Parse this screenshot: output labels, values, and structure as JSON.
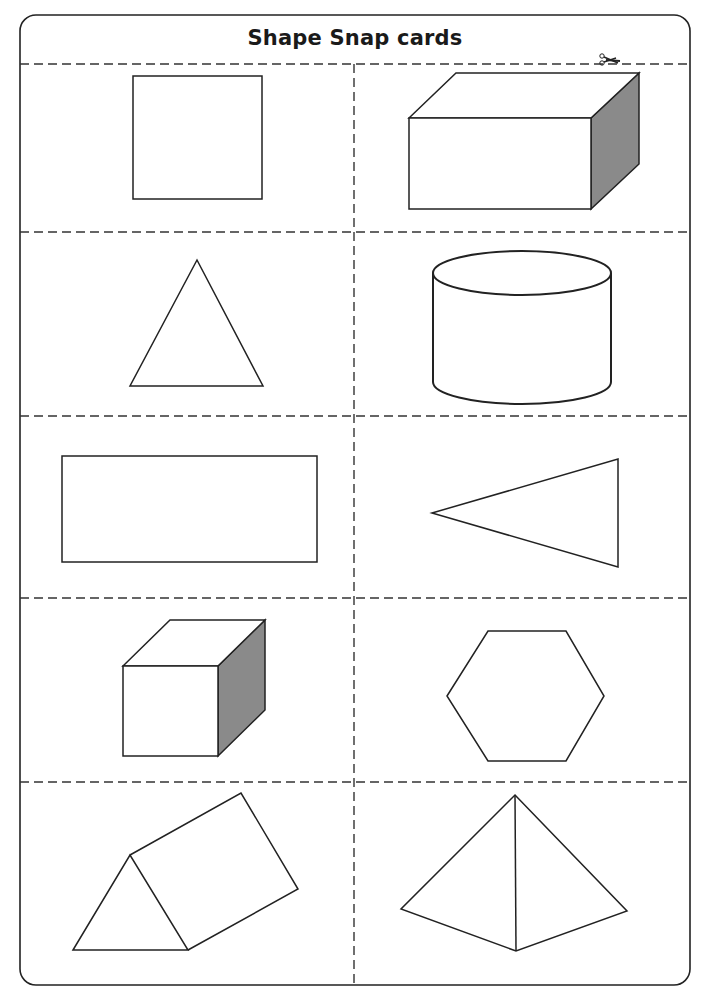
{
  "page": {
    "title": "Shape Snap cards",
    "cut_icon": "scissors-icon",
    "colors": {
      "line": "#222222",
      "dash": "#333333",
      "shade": "#8a8a8a",
      "paper": "#ffffff"
    }
  },
  "cards": [
    {
      "row": 1,
      "col": 1,
      "shape": "square"
    },
    {
      "row": 1,
      "col": 2,
      "shape": "cuboid"
    },
    {
      "row": 2,
      "col": 1,
      "shape": "triangle"
    },
    {
      "row": 2,
      "col": 2,
      "shape": "cylinder"
    },
    {
      "row": 3,
      "col": 1,
      "shape": "rectangle"
    },
    {
      "row": 3,
      "col": 2,
      "shape": "triangle (rotated)"
    },
    {
      "row": 4,
      "col": 1,
      "shape": "cube"
    },
    {
      "row": 4,
      "col": 2,
      "shape": "hexagon"
    },
    {
      "row": 5,
      "col": 1,
      "shape": "triangular prism"
    },
    {
      "row": 5,
      "col": 2,
      "shape": "pyramid"
    }
  ]
}
